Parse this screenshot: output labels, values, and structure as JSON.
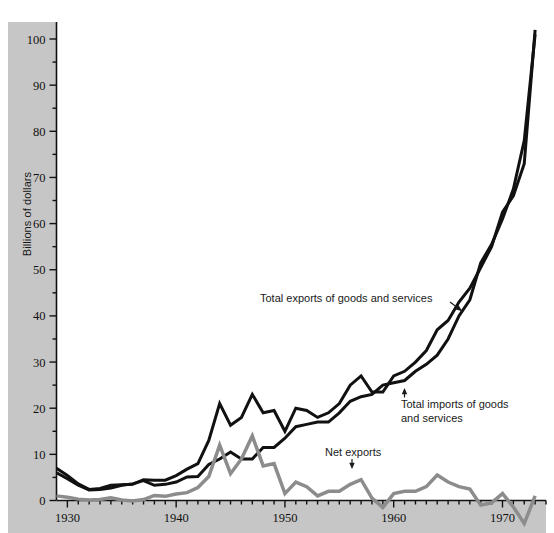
{
  "figure": {
    "title": "",
    "y_axis_title": "Billions of dollars",
    "background_color": "#ffffff",
    "band_color": "#c6c6c6",
    "axis_color": "#111111"
  },
  "annotations": {
    "exports": {
      "label": "Total exports of goods and services"
    },
    "imports": {
      "line1": "Total imports of goods",
      "line2": "and services"
    },
    "net": {
      "label": "Net exports"
    }
  },
  "ticks": {
    "y": [
      "0",
      "10",
      "20",
      "30",
      "40",
      "50",
      "60",
      "70",
      "80",
      "90",
      "100"
    ],
    "x": [
      "1930",
      "1940",
      "1950",
      "1960",
      "1970"
    ]
  },
  "chart_data": {
    "type": "line",
    "title": "",
    "xlabel": "",
    "ylabel": "Billions of dollars",
    "xlim": [
      1929,
      1974
    ],
    "ylim": [
      -6,
      105
    ],
    "yticks": [
      0,
      10,
      20,
      30,
      40,
      50,
      60,
      70,
      80,
      90,
      100
    ],
    "ytick_minor_step": 5,
    "xticks": [
      1930,
      1940,
      1950,
      1960,
      1970
    ],
    "xtick_minor_step": 1,
    "grid": false,
    "legend": "in-plot annotations",
    "x": [
      1929,
      1930,
      1931,
      1932,
      1933,
      1934,
      1935,
      1936,
      1937,
      1938,
      1939,
      1940,
      1941,
      1942,
      1943,
      1944,
      1945,
      1946,
      1947,
      1948,
      1949,
      1950,
      1951,
      1952,
      1953,
      1954,
      1955,
      1956,
      1957,
      1958,
      1959,
      1960,
      1961,
      1962,
      1963,
      1964,
      1965,
      1966,
      1967,
      1968,
      1969,
      1970,
      1971,
      1972,
      1973
    ],
    "series": [
      {
        "name": "Total exports of goods and services",
        "color": "#111111",
        "width": 3,
        "values": [
          7.0,
          5.4,
          3.6,
          2.4,
          2.6,
          3.3,
          3.4,
          3.5,
          4.5,
          4.4,
          4.4,
          5.4,
          6.8,
          8.0,
          13.0,
          21.0,
          16.3,
          18.0,
          23.0,
          19.0,
          19.5,
          15.0,
          20.0,
          19.5,
          18.0,
          19.0,
          21.0,
          25.0,
          27.0,
          23.5,
          23.5,
          27.0,
          28.0,
          30.0,
          32.5,
          37.0,
          39.0,
          43.0,
          46.0,
          50.5,
          55.0,
          62.5,
          66.0,
          73.0,
          102.0
        ]
      },
      {
        "name": "Total imports of goods and services",
        "color": "#111111",
        "width": 3,
        "values": [
          6.0,
          4.7,
          3.3,
          2.3,
          2.4,
          2.7,
          3.3,
          3.6,
          4.3,
          3.3,
          3.5,
          4.0,
          5.1,
          5.2,
          7.8,
          9.0,
          10.5,
          9.0,
          9.0,
          11.5,
          11.5,
          13.5,
          16.0,
          16.5,
          17.0,
          17.0,
          19.0,
          21.5,
          22.5,
          23.0,
          25.0,
          25.5,
          26.0,
          28.0,
          29.5,
          31.5,
          35.0,
          40.0,
          43.5,
          51.5,
          55.5,
          61.0,
          67.5,
          78.0,
          101.0
        ]
      },
      {
        "name": "Net exports",
        "color": "#8c8c8c",
        "width": 3.5,
        "values": [
          1.0,
          0.7,
          0.3,
          0.1,
          0.2,
          0.6,
          0.1,
          -0.1,
          0.2,
          1.1,
          0.9,
          1.4,
          1.7,
          2.8,
          5.2,
          12.0,
          5.8,
          9.0,
          14.0,
          7.5,
          8.0,
          1.5,
          4.0,
          3.0,
          1.0,
          2.0,
          2.0,
          3.5,
          4.5,
          0.5,
          -1.5,
          1.5,
          2.0,
          2.0,
          3.0,
          5.5,
          4.0,
          3.0,
          2.5,
          -1.0,
          -0.5,
          1.5,
          -1.4,
          -5.0,
          1.0
        ]
      }
    ]
  }
}
